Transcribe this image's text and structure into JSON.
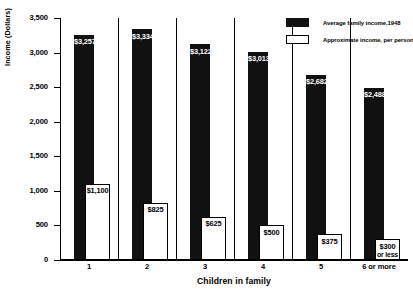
{
  "chart_data": {
    "type": "bar",
    "title": "",
    "xlabel": "Children in family",
    "ylabel": "Income (Dollars)",
    "ylim": [
      0,
      3500
    ],
    "yticks": [
      0,
      500,
      1000,
      1500,
      2000,
      2500,
      3000,
      3500
    ],
    "ytick_labels": [
      "0",
      "500",
      "1,000",
      "1,500",
      "2,000",
      "2,500",
      "3,000",
      "3,500"
    ],
    "grid": false,
    "legend_position": "top-right",
    "categories": [
      "1",
      "2",
      "3",
      "4",
      "5",
      "6 or more"
    ],
    "series": [
      {
        "name": "Average family income,1948",
        "color": "#111111",
        "values": [
          3257,
          3334,
          3122,
          3013,
          2682,
          2488
        ],
        "data_labels": [
          "$3,257",
          "$3,334",
          "$3,122",
          "$3,013",
          "$2,682",
          "$2,488"
        ]
      },
      {
        "name": "Approximate income, per person",
        "color": "#ffffff",
        "values": [
          1100,
          825,
          625,
          500,
          375,
          300
        ],
        "data_labels": [
          "$1,100",
          "$825",
          "$625",
          "$500",
          "$375",
          "$300"
        ],
        "data_label_suffix": [
          null,
          null,
          null,
          null,
          null,
          "or less"
        ]
      }
    ]
  },
  "legend": {
    "items": [
      {
        "label": "Average family income,1948",
        "swatch": "filled"
      },
      {
        "label": "Approximate income, per person",
        "swatch": "open"
      }
    ]
  },
  "axes": {
    "y_title": "Income (Dollars)",
    "x_title": "Children in family"
  }
}
